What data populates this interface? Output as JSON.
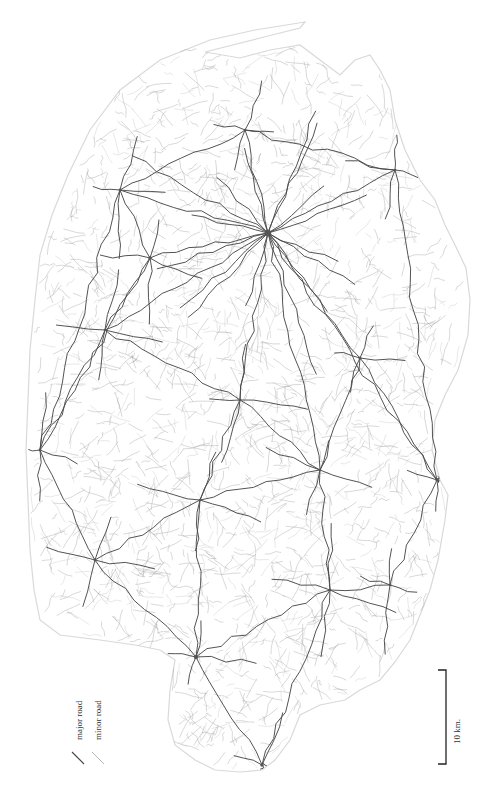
{
  "map": {
    "title": "Road network map",
    "width": 487,
    "height": 794,
    "outline": [
      [
        205,
        52
      ],
      [
        260,
        38
      ],
      [
        300,
        28
      ],
      [
        305,
        22
      ],
      [
        255,
        30
      ],
      [
        210,
        40
      ],
      [
        160,
        60
      ],
      [
        120,
        90
      ],
      [
        90,
        130
      ],
      [
        68,
        175
      ],
      [
        52,
        215
      ],
      [
        40,
        255
      ],
      [
        35,
        300
      ],
      [
        30,
        350
      ],
      [
        28,
        400
      ],
      [
        26,
        450
      ],
      [
        28,
        500
      ],
      [
        30,
        550
      ],
      [
        34,
        590
      ],
      [
        40,
        620
      ],
      [
        60,
        635
      ],
      [
        100,
        640
      ],
      [
        135,
        645
      ],
      [
        160,
        650
      ],
      [
        175,
        660
      ],
      [
        170,
        690
      ],
      [
        168,
        720
      ],
      [
        175,
        745
      ],
      [
        195,
        760
      ],
      [
        215,
        770
      ],
      [
        240,
        772
      ],
      [
        262,
        770
      ],
      [
        275,
        760
      ],
      [
        290,
        740
      ],
      [
        300,
        715
      ],
      [
        320,
        705
      ],
      [
        345,
        700
      ],
      [
        360,
        690
      ],
      [
        380,
        680
      ],
      [
        395,
        662
      ],
      [
        410,
        640
      ],
      [
        420,
        615
      ],
      [
        430,
        590
      ],
      [
        438,
        560
      ],
      [
        445,
        520
      ],
      [
        448,
        495
      ],
      [
        440,
        480
      ],
      [
        432,
        450
      ],
      [
        435,
        420
      ],
      [
        445,
        395
      ],
      [
        458,
        370
      ],
      [
        468,
        335
      ],
      [
        470,
        300
      ],
      [
        466,
        268
      ],
      [
        455,
        245
      ],
      [
        445,
        225
      ],
      [
        435,
        200
      ],
      [
        420,
        180
      ],
      [
        405,
        150
      ],
      [
        395,
        120
      ],
      [
        390,
        90
      ],
      [
        380,
        70
      ],
      [
        370,
        55
      ],
      [
        355,
        60
      ],
      [
        340,
        75
      ],
      [
        320,
        60
      ],
      [
        300,
        45
      ],
      [
        270,
        50
      ],
      [
        240,
        58
      ]
    ],
    "hubs": [
      {
        "name": "central-town",
        "x": 268,
        "y": 233,
        "r": 3.2
      },
      {
        "name": "west-town",
        "x": 150,
        "y": 258,
        "r": 1.8
      },
      {
        "name": "northwest-town",
        "x": 120,
        "y": 190,
        "r": 1.4
      },
      {
        "name": "north-town",
        "x": 245,
        "y": 130,
        "r": 1.3
      },
      {
        "name": "northeast-town",
        "x": 395,
        "y": 170,
        "r": 1.3
      },
      {
        "name": "east-town",
        "x": 360,
        "y": 358,
        "r": 1.6
      },
      {
        "name": "southeast-town",
        "x": 437,
        "y": 480,
        "r": 1.6
      },
      {
        "name": "center-south-town",
        "x": 240,
        "y": 400,
        "r": 1.4
      },
      {
        "name": "west-coast-town",
        "x": 40,
        "y": 450,
        "r": 1.4
      },
      {
        "name": "southwest-town",
        "x": 95,
        "y": 560,
        "r": 1.4
      },
      {
        "name": "south-junction",
        "x": 330,
        "y": 590,
        "r": 1.3
      },
      {
        "name": "south-town",
        "x": 196,
        "y": 657,
        "r": 2.2
      },
      {
        "name": "southern-port",
        "x": 262,
        "y": 765,
        "r": 1.8
      },
      {
        "name": "mid-west-town",
        "x": 105,
        "y": 330,
        "r": 1.3
      },
      {
        "name": "mid-town",
        "x": 200,
        "y": 500,
        "r": 1.3
      },
      {
        "name": "mid-east-town",
        "x": 320,
        "y": 470,
        "r": 1.3
      },
      {
        "name": "south-east-village",
        "x": 390,
        "y": 585,
        "r": 1.2
      }
    ],
    "major_links": [
      [
        0,
        1
      ],
      [
        0,
        3
      ],
      [
        0,
        4
      ],
      [
        0,
        5
      ],
      [
        0,
        7
      ],
      [
        0,
        13
      ],
      [
        0,
        2
      ],
      [
        1,
        2
      ],
      [
        1,
        13
      ],
      [
        1,
        8
      ],
      [
        2,
        3
      ],
      [
        3,
        4
      ],
      [
        4,
        6
      ],
      [
        5,
        6
      ],
      [
        5,
        15
      ],
      [
        7,
        14
      ],
      [
        7,
        13
      ],
      [
        7,
        15
      ],
      [
        8,
        9
      ],
      [
        9,
        14
      ],
      [
        9,
        11
      ],
      [
        11,
        12
      ],
      [
        11,
        14
      ],
      [
        14,
        15
      ],
      [
        15,
        10
      ],
      [
        10,
        16
      ],
      [
        16,
        6
      ],
      [
        10,
        11
      ],
      [
        13,
        8
      ],
      [
        0,
        15
      ],
      [
        0,
        6
      ],
      [
        2,
        8
      ],
      [
        12,
        10
      ]
    ],
    "legend": {
      "major_label": "major road",
      "minor_label": "minor road"
    },
    "scale": {
      "label": "10 km.",
      "length_px": 124
    },
    "colors": {
      "major": "#4a4a4a",
      "minor": "#9a9a9a",
      "outline": "#d9d9d9",
      "background": "#ffffff"
    }
  }
}
